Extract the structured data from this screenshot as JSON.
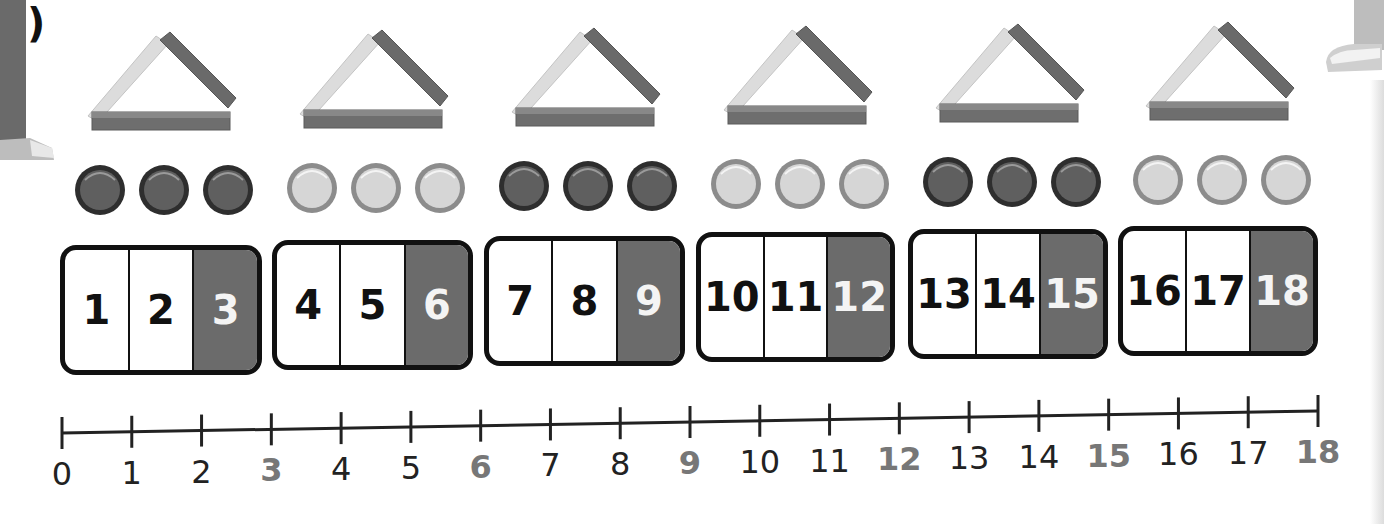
{
  "part_label": "a)",
  "groups": [
    {
      "triangle": "triangle-of-sticks",
      "counters": "dark",
      "cells": [
        "1",
        "2",
        "3"
      ]
    },
    {
      "triangle": "triangle-of-sticks",
      "counters": "light",
      "cells": [
        "4",
        "5",
        "6"
      ]
    },
    {
      "triangle": "triangle-of-sticks",
      "counters": "dark",
      "cells": [
        "7",
        "8",
        "9"
      ]
    },
    {
      "triangle": "triangle-of-sticks",
      "counters": "light",
      "cells": [
        "10",
        "11",
        "12"
      ]
    },
    {
      "triangle": "triangle-of-sticks",
      "counters": "dark",
      "cells": [
        "13",
        "14",
        "15"
      ]
    },
    {
      "triangle": "triangle-of-sticks",
      "counters": "light",
      "cells": [
        "16",
        "17",
        "18"
      ]
    }
  ],
  "number_line": {
    "start": 0,
    "end": 18,
    "labels": [
      "0",
      "1",
      "2",
      "3",
      "4",
      "5",
      "6",
      "7",
      "8",
      "9",
      "10",
      "11",
      "12",
      "13",
      "14",
      "15",
      "16",
      "17",
      "18"
    ],
    "highlighted": [
      "3",
      "6",
      "9",
      "12",
      "15",
      "18"
    ]
  },
  "colors": {
    "dark_counter": "#5f5f5f",
    "dark_counter_ring": "#2e2e2e",
    "light_counter": "#d6d6d6",
    "light_counter_ring": "#8c8c8c",
    "shaded_cell": "#6b6b6b",
    "highlight_label": "#777777"
  }
}
